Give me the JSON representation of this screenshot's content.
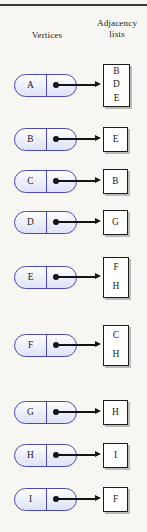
{
  "figure": {
    "headers": {
      "vertices": "Vertices",
      "adjacency": "Adjacency\nlists",
      "adjacency_line1": "Adjacency",
      "adjacency_line2": "lists"
    },
    "colors": {
      "background": "#f7f6f3",
      "vertex_border": "#4a4ab4",
      "vertex_fill": "#e4e8f8",
      "box_border": "#1c1c1c",
      "box_fill": "#ffffff",
      "arrow": "#151515",
      "rule": "#3a3a3a",
      "text": "#1a1a1a"
    },
    "rows": [
      {
        "vertex": "A",
        "adjacent": [
          "B",
          "D",
          "E"
        ],
        "y": 85
      },
      {
        "vertex": "B",
        "adjacent": [
          "E"
        ],
        "y": 139
      },
      {
        "vertex": "C",
        "adjacent": [
          "B"
        ],
        "y": 181
      },
      {
        "vertex": "D",
        "adjacent": [
          "G"
        ],
        "y": 222
      },
      {
        "vertex": "E",
        "adjacent": [
          "F",
          "H"
        ],
        "y": 277
      },
      {
        "vertex": "F",
        "adjacent": [
          "C",
          "H"
        ],
        "y": 345
      },
      {
        "vertex": "G",
        "adjacent": [
          "H"
        ],
        "y": 412
      },
      {
        "vertex": "H",
        "adjacent": [
          "I"
        ],
        "y": 455
      },
      {
        "vertex": "I",
        "adjacent": [
          "F"
        ],
        "y": 499
      }
    ]
  }
}
